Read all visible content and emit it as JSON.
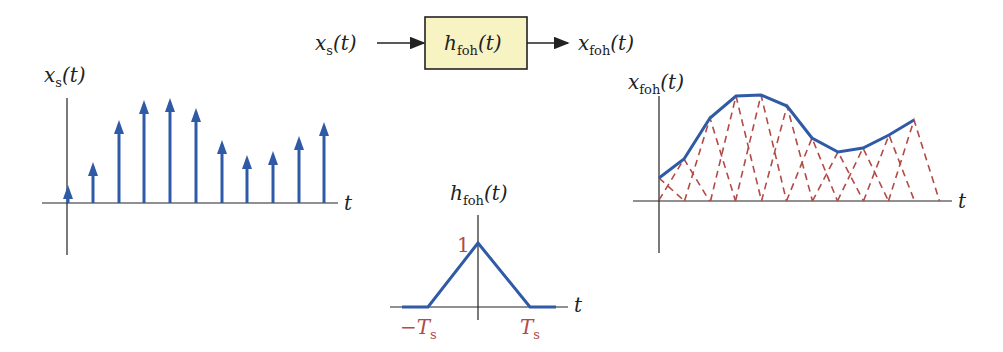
{
  "block_diagram": {
    "input_label": "x_s(t)",
    "system_label": "h_foh(t)",
    "output_label": "x_foh(t)",
    "box_fill": "#f7f3c2"
  },
  "left_plot": {
    "ylabel": "x_s(t)",
    "xlabel": "t",
    "stem_color": "#2f5aa6",
    "samples_x": [
      68,
      93,
      119,
      144,
      170,
      196,
      222,
      247,
      273,
      299,
      324
    ],
    "samples_top": [
      185,
      162,
      120,
      100,
      98,
      108,
      140,
      155,
      151,
      136,
      122
    ]
  },
  "center_plot": {
    "ylabel": "h_foh(t)",
    "xlabel": "t",
    "peak_label": "1",
    "left_tick": "−T_s",
    "right_tick": "T_s"
  },
  "right_plot": {
    "ylabel": "x_foh(t)",
    "xlabel": "t",
    "line_color": "#2f5aa6",
    "dash_color": "#b24a45"
  },
  "chart_data": [
    {
      "type": "line",
      "title": "x_s(t) impulse train",
      "x": [
        0,
        1,
        2,
        3,
        4,
        5,
        6,
        7,
        8,
        9,
        10
      ],
      "values": [
        0.18,
        0.41,
        0.83,
        1.03,
        1.05,
        0.95,
        0.63,
        0.48,
        0.52,
        0.67,
        0.81
      ]
    },
    {
      "type": "line",
      "title": "h_foh(t)",
      "x": [
        -2,
        -1,
        0,
        1,
        2
      ],
      "values": [
        0,
        0,
        1,
        0,
        0
      ]
    },
    {
      "type": "line",
      "title": "x_foh(t)",
      "x": [
        0,
        1,
        2,
        3,
        4,
        5,
        6,
        7,
        8,
        9,
        10
      ],
      "values": [
        0.23,
        0.42,
        0.83,
        1.05,
        1.06,
        0.95,
        0.63,
        0.49,
        0.53,
        0.66,
        0.81
      ]
    }
  ]
}
